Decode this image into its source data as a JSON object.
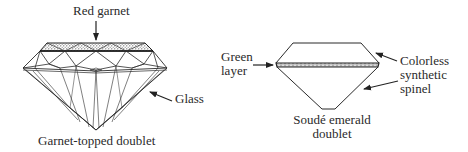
{
  "figures": [
    {
      "id": "garnet-topped-doublet",
      "caption": "Garnet-topped doublet",
      "labels": {
        "top": "Red garnet",
        "side": "Glass"
      }
    },
    {
      "id": "soude-emerald-doublet",
      "caption_line1": "Soudé emerald",
      "caption_line2": "doublet",
      "labels": {
        "left_line1": "Green",
        "left_line2": "layer",
        "right_line1": "Colorless",
        "right_line2": "synthetic",
        "right_line3": "spinel"
      }
    }
  ],
  "colors": {
    "line": "#2a2a2a",
    "stipple": "#555555",
    "background": "#ffffff"
  }
}
